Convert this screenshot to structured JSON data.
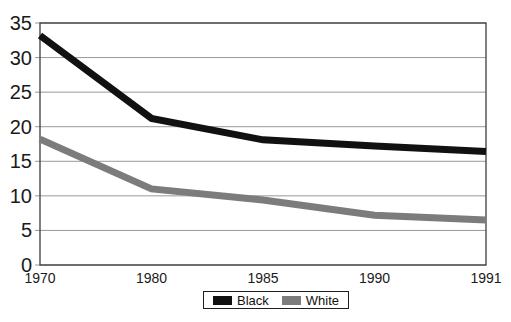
{
  "chart": {
    "background_color": "#ffffff",
    "frame_color": "#3c3c3c",
    "grid_color": "#999999",
    "axis_text_color": "#1a1a1a",
    "legend_border_color": "#1f1f1f"
  },
  "chart_data": {
    "type": "line",
    "title": "",
    "xlabel": "",
    "ylabel": "",
    "categories": [
      "1970",
      "1980",
      "1985",
      "1990",
      "1991"
    ],
    "series": [
      {
        "name": "Black",
        "color": "#111111",
        "values": [
          33.2,
          21.2,
          18.1,
          17.2,
          16.4
        ]
      },
      {
        "name": "White",
        "color": "#7c7c7c",
        "values": [
          18.2,
          11.0,
          9.4,
          7.2,
          6.5
        ]
      }
    ],
    "ylim": [
      0,
      35
    ],
    "yticks": [
      0,
      5,
      10,
      15,
      20,
      25,
      30,
      35
    ],
    "grid": "on",
    "legend_position": "bottom-center",
    "x_axis_type": "categorical-equal-spacing"
  }
}
